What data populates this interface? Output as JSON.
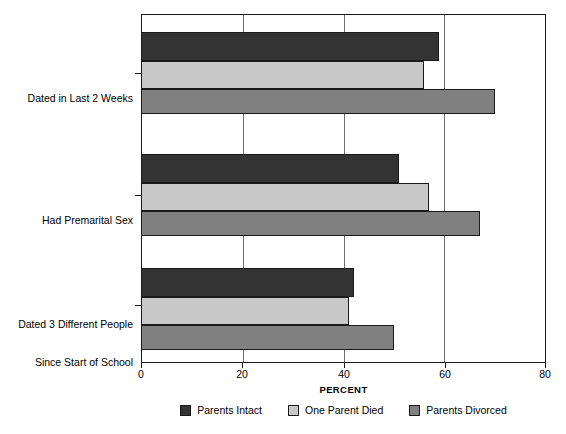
{
  "chart_data": {
    "type": "bar",
    "orientation": "horizontal",
    "title": "",
    "xlabel": "PERCENT",
    "ylabel": "",
    "xlim": [
      0,
      80
    ],
    "xticks": [
      0,
      20,
      40,
      60,
      80
    ],
    "xticklabels": [
      "0",
      "20",
      "40",
      "60",
      "80"
    ],
    "grid": true,
    "grid_axis": "x",
    "legend_position": "bottom",
    "categories": [
      "Dated in Last 2 Weeks",
      "Had Premarital Sex",
      "Dated 3 Different People\nSince Start of School"
    ],
    "series": [
      {
        "name": "Parents Intact",
        "color": "#333333",
        "values": [
          59,
          51,
          42
        ]
      },
      {
        "name": "One Parent Died",
        "color": "#c8c8c8",
        "values": [
          56,
          57,
          41
        ]
      },
      {
        "name": "Parents Divorced",
        "color": "#808080",
        "values": [
          70,
          67,
          50
        ]
      }
    ]
  },
  "axis": {
    "x_title": "PERCENT",
    "tick_labels": [
      "0",
      "20",
      "40",
      "60",
      "80"
    ]
  },
  "categories": [
    {
      "line1": "Dated in Last 2 Weeks",
      "line2": ""
    },
    {
      "line1": "Had Premarital Sex",
      "line2": ""
    },
    {
      "line1": "Dated 3 Different People",
      "line2": "Since Start of School"
    }
  ],
  "legend": {
    "items": [
      {
        "label": "Parents Intact"
      },
      {
        "label": "One Parent Died"
      },
      {
        "label": "Parents Divorced"
      }
    ]
  },
  "colors": {
    "series_0": "#333333",
    "series_1": "#c8c8c8",
    "series_2": "#808080",
    "axis": "#1a1a1a",
    "grid": "#6b6b6b",
    "background": "#ffffff"
  }
}
